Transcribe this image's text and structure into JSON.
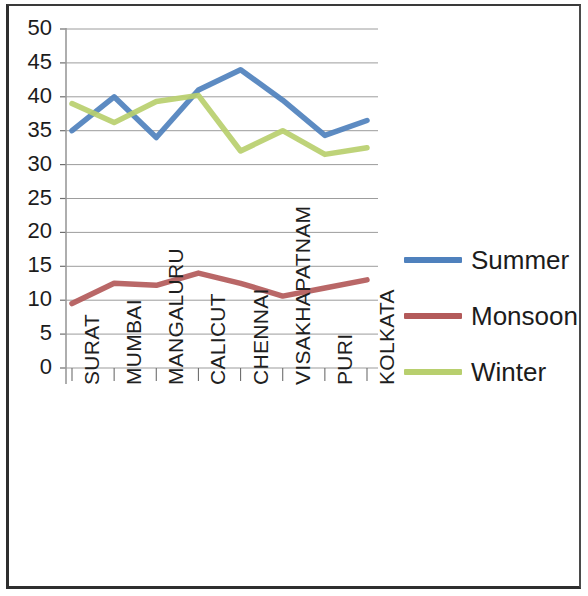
{
  "chart_data": {
    "type": "line",
    "title": "",
    "xlabel": "",
    "ylabel": "",
    "categories": [
      "SURAT",
      "MUMBAI",
      "MANGALURU",
      "CALICUT",
      "CHENNAI",
      "VISAKHAPATNAM",
      "PURI",
      "KOLKATA"
    ],
    "series": [
      {
        "name": "Summer",
        "color": "#4F81BD",
        "values": [
          35,
          40,
          34,
          41,
          44,
          39.5,
          34.3,
          36.5
        ]
      },
      {
        "name": "Monsoon",
        "color": "#B35A5A",
        "values": [
          9.5,
          12.5,
          12.2,
          14,
          12.5,
          10.6,
          11.8,
          13
        ]
      },
      {
        "name": "Winter",
        "color": "#B8CF6E",
        "values": [
          39,
          36.2,
          39.3,
          40.2,
          32,
          35,
          31.5,
          32.5
        ]
      }
    ],
    "ylim": [
      0,
      50
    ],
    "ytick_step": 5,
    "yticks": [
      "50",
      "45",
      "40",
      "35",
      "30",
      "25",
      "20",
      "15",
      "10",
      "5",
      "0"
    ],
    "grid": true,
    "legend_position": "right"
  },
  "legend": {
    "entries": [
      {
        "label": "Summer",
        "color": "#4F81BD"
      },
      {
        "label": "Monsoon",
        "color": "#B35A5A"
      },
      {
        "label": "Winter",
        "color": "#B8CF6E"
      }
    ]
  },
  "axes": {
    "y_color": "#9a9a9a",
    "grid_color": "#8c8c8c",
    "tick_color": "#6e6e6e"
  },
  "frame": {
    "border_color": "#2e2e2e",
    "background": "#ffffff"
  }
}
